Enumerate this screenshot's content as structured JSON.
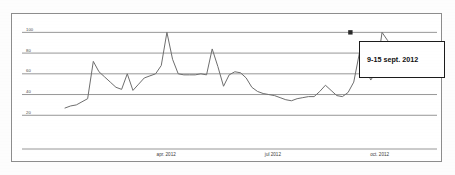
{
  "chart_data": {
    "type": "line",
    "title": "",
    "subtitle": "",
    "xlabel": "",
    "ylabel": "",
    "ylim": [
      0,
      110
    ],
    "grid": true,
    "legend_position": "none",
    "y_ticks": [
      100,
      80,
      60,
      40,
      20
    ],
    "y_tick_labels": [
      "100",
      "80",
      "60",
      "40",
      "20"
    ],
    "x_tick_labels": [
      "apr. 2012",
      "jul 2012",
      "oct. 2012"
    ],
    "x_tick_positions": [
      0.275,
      0.565,
      0.855
    ],
    "annotation": {
      "label": "9-15 sept. 2012",
      "marker_x_fraction": 0.7755,
      "marker_value": 100
    },
    "series": [
      {
        "name": "search interest",
        "color": "#6e6e6e",
        "values": [
          27,
          29,
          30,
          33,
          36,
          72,
          62,
          57,
          52,
          47,
          45,
          60,
          44,
          50,
          56,
          58,
          60,
          68,
          100,
          74,
          60,
          59,
          59,
          59,
          60,
          59,
          84,
          67,
          48,
          59,
          62,
          61,
          56,
          47,
          43,
          41,
          40,
          39,
          37,
          35,
          34,
          36,
          37,
          38,
          38,
          43,
          49,
          44,
          39,
          38,
          42,
          52,
          80,
          67,
          54,
          62,
          100,
          92,
          75,
          64,
          60,
          59,
          60,
          63,
          58,
          62
        ]
      }
    ]
  },
  "frame": {
    "border_color": "#8d8d8d",
    "background": "#ffffff"
  },
  "colors": {
    "gridline": "#8a8a8a",
    "line": "#6e6e6e",
    "tooltip_border": "#1b1b1b",
    "tooltip_text": "#101010",
    "tick_text": "#4a4a4a"
  }
}
